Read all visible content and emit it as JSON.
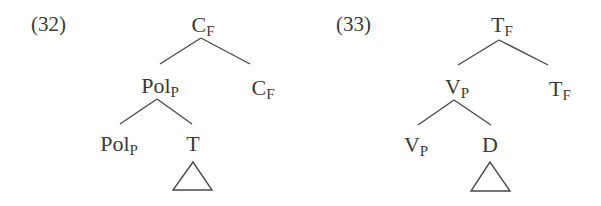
{
  "examples": [
    {
      "number": "(32)",
      "tree": {
        "root": {
          "cat": "C",
          "sub": "F"
        },
        "left": {
          "cat": "Pol",
          "sub": "P"
        },
        "right": {
          "cat": "C",
          "sub": "F"
        },
        "left_left": {
          "cat": "Pol",
          "sub": "P"
        },
        "left_right": {
          "cat": "T",
          "sub": "",
          "triangle": true
        }
      }
    },
    {
      "number": "(33)",
      "tree": {
        "root": {
          "cat": "T",
          "sub": "F"
        },
        "left": {
          "cat": "V",
          "sub": "P"
        },
        "right": {
          "cat": "T",
          "sub": "F"
        },
        "left_left": {
          "cat": "V",
          "sub": "P"
        },
        "left_right": {
          "cat": "D",
          "sub": "",
          "triangle": true
        }
      }
    }
  ]
}
